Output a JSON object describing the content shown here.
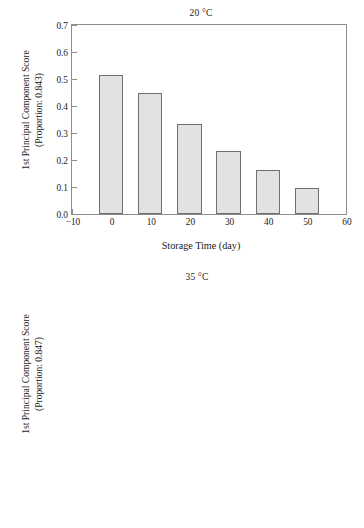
{
  "figure": {
    "width": 364,
    "height": 528,
    "background": "#ffffff",
    "bar_fill": "#e2e2e2",
    "bar_edge": "#6f6f6f",
    "axis_color": "#8d8d8d",
    "text_color": "#1a1a1a"
  },
  "chart_data": [
    {
      "type": "bar",
      "panel_id": "top",
      "title": "20 °C",
      "xlabel": "Storage Time (day)",
      "ylabel": "1st Principal Component Score",
      "ylabel_line1": "1st Principal Component Score",
      "ylabel_line2": "(Proportion: 0.843)",
      "proportion": "0.843",
      "categories": [
        0,
        10,
        20,
        30,
        40,
        50
      ],
      "values": [
        0.513,
        0.45,
        0.335,
        0.233,
        0.163,
        0.095
      ],
      "xlim": [
        -10,
        60
      ],
      "ylim": [
        0.0,
        0.7
      ],
      "xticks": [
        -10,
        0,
        10,
        20,
        30,
        40,
        50,
        60
      ],
      "xtick_labels": [
        "−10",
        "0",
        "10",
        "20",
        "30",
        "40",
        "50",
        "60"
      ],
      "yticks": [
        0.0,
        0.1,
        0.2,
        0.3,
        0.4,
        0.5,
        0.6,
        0.7
      ],
      "ytick_labels": [
        "0.0",
        "0.1",
        "0.2",
        "0.3",
        "0.4",
        "0.5",
        "0.6",
        "0.7"
      ],
      "bar_width_units": 6.2,
      "grid": false,
      "legend": null
    },
    {
      "type": "bar",
      "panel_id": "bottom",
      "title": "35 °C",
      "xlabel": "Storage Time (day)",
      "ylabel": "1st Principal Component Score",
      "ylabel_line1": "1st Principal Component Score",
      "ylabel_line2": "(Proportion: 0.847)",
      "proportion": "0.847",
      "categories": [
        0,
        5,
        10,
        15,
        20,
        25,
        30,
        35,
        40,
        45
      ],
      "values": [
        0.182,
        0.161,
        0.101,
        0.043,
        -0.027,
        -0.061,
        -0.069,
        -0.079,
        -0.153,
        -0.205
      ],
      "xlim": [
        -3.5,
        50
      ],
      "ylim": [
        -0.3,
        0.4
      ],
      "xticks": [
        0,
        5,
        10,
        15,
        20,
        25,
        30,
        35,
        40,
        45,
        50
      ],
      "xtick_labels": [
        "0",
        "5",
        "10",
        "15",
        "20",
        "25",
        "30",
        "35",
        "40",
        "45",
        "50"
      ],
      "yticks": [
        -0.3,
        -0.2,
        -0.1,
        0,
        0.1,
        0.2,
        0.3,
        0.4
      ],
      "ytick_labels": [
        "−0.3",
        "−0.2",
        "−0.1",
        "0",
        "0.1",
        "0.2",
        "0.3",
        "0.4"
      ],
      "bar_width_units": 3.1,
      "bar_baseline": -0.3,
      "grid": false,
      "legend": null
    }
  ]
}
